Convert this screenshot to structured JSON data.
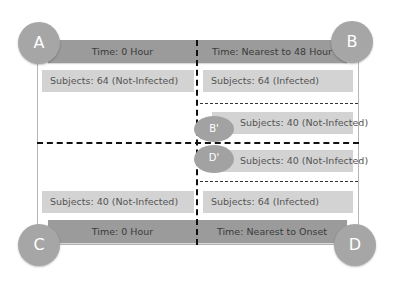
{
  "diagram": {
    "corners": {
      "A": {
        "label": "A"
      },
      "B": {
        "label": "B"
      },
      "C": {
        "label": "C"
      },
      "D": {
        "label": "D"
      },
      "B_prime": {
        "label": "B'"
      },
      "D_prime": {
        "label": "D'"
      }
    },
    "top_left": {
      "time": "Time: 0 Hour",
      "subjects": "Subjects: 64 (Not-Infected)"
    },
    "top_right": {
      "time": "Time: Nearest to 48 Hour",
      "subjects": "Subjects: 64 (Infected)"
    },
    "middle_right": {
      "b_prime_subjects": "Subjects: 40 (Not-Infected)",
      "d_prime_subjects": "Subjects: 40 (Not-Infected)"
    },
    "bottom_left": {
      "subjects": "Subjects: 40 (Not-Infected)",
      "time": "Time: 0 Hour"
    },
    "bottom_right": {
      "subjects": "Subjects: 64 (Infected)",
      "time": "Time: Nearest to Onset"
    }
  },
  "colors": {
    "circle": "#a6a6a6",
    "time_bar": "#9b9b9b",
    "subject_bar": "#d3d3d3",
    "dashed_line": "#111111"
  }
}
